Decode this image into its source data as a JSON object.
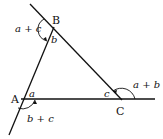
{
  "diagram": {
    "type": "triangle-exterior-angles",
    "vertices": [
      {
        "id": "A",
        "label": "A",
        "x": 22,
        "y": 99
      },
      {
        "id": "B",
        "label": "B",
        "x": 53,
        "y": 28
      },
      {
        "id": "C",
        "label": "C",
        "x": 120,
        "y": 99
      }
    ],
    "interior_angles": {
      "a": "a",
      "b": "b",
      "c": "c"
    },
    "exterior_angles": {
      "at_A": "b + c",
      "at_B": "a + c",
      "at_C": "a + b"
    },
    "colors": {
      "line": "#111111",
      "background": "#ffffff"
    }
  }
}
